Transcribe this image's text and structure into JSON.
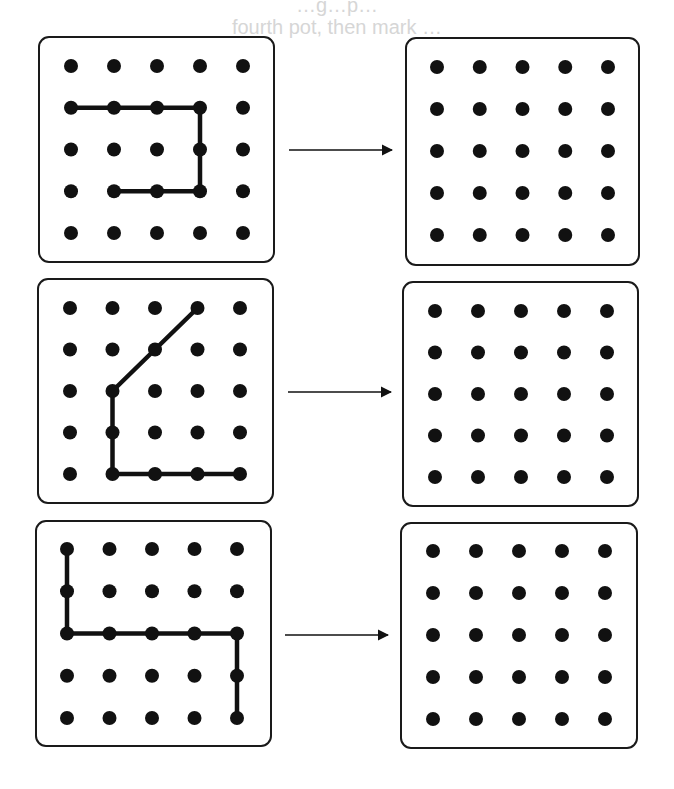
{
  "header": {
    "faint_text_line1": "…g…p…",
    "faint_text_line2": "fourth pot, then mark …"
  },
  "style": {
    "ink": "#111111",
    "box_border": "#1a1a1a",
    "background": "#ffffff",
    "faint_text": "#d6d6d6"
  },
  "grid": {
    "rows": 5,
    "cols": 5,
    "dot_radius": 7
  },
  "rows": [
    {
      "left_box": {
        "x": 39,
        "y": 37,
        "w": 235,
        "h": 225,
        "dot_origin": [
          71,
          66
        ],
        "dot_step": [
          43,
          41.75
        ]
      },
      "right_box": {
        "x": 406,
        "y": 38,
        "w": 233,
        "h": 227,
        "dot_origin": [
          437,
          67
        ],
        "dot_step": [
          42.75,
          42
        ]
      },
      "arrow": {
        "x1": 289,
        "x2": 392,
        "y": 150
      },
      "path": [
        [
          1,
          0
        ],
        [
          1,
          3
        ],
        [
          3,
          3
        ],
        [
          3,
          1
        ]
      ],
      "path_description": "Row 2 from col 1 to col 4, down to row 4, back left to col 2"
    },
    {
      "left_box": {
        "x": 38,
        "y": 279,
        "w": 235,
        "h": 224,
        "dot_origin": [
          70,
          308
        ],
        "dot_step": [
          42.5,
          41.5
        ]
      },
      "right_box": {
        "x": 403,
        "y": 282,
        "w": 235,
        "h": 224,
        "dot_origin": [
          435,
          311
        ],
        "dot_step": [
          43,
          41.5
        ]
      },
      "arrow": {
        "x1": 288,
        "x2": 391,
        "y": 392
      },
      "path": [
        [
          0,
          3
        ],
        [
          2,
          1
        ],
        [
          4,
          1
        ],
        [
          4,
          4
        ]
      ],
      "path_description": "Diagonal from top row col 4 to row 3 col 2, down to bottom row, then right to col 5"
    },
    {
      "left_box": {
        "x": 36,
        "y": 521,
        "w": 235,
        "h": 225,
        "dot_origin": [
          67,
          549
        ],
        "dot_step": [
          42.5,
          42.25
        ]
      },
      "right_box": {
        "x": 401,
        "y": 523,
        "w": 236,
        "h": 225,
        "dot_origin": [
          433,
          551
        ],
        "dot_step": [
          43,
          42
        ]
      },
      "arrow": {
        "x1": 285,
        "x2": 388,
        "y": 635
      },
      "path": [
        [
          0,
          0
        ],
        [
          2,
          0
        ],
        [
          2,
          4
        ],
        [
          4,
          4
        ]
      ],
      "path_description": "Down left column to row 3, right across to col 5, down to bottom row"
    }
  ]
}
